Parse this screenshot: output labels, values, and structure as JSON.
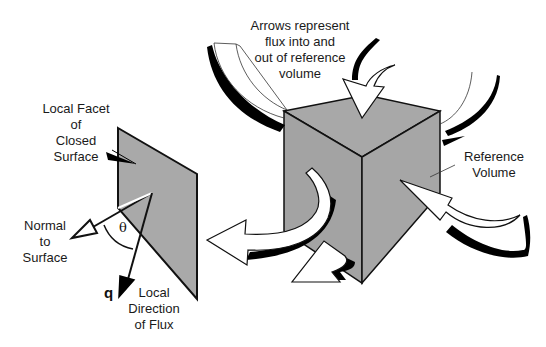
{
  "diagram": {
    "colors": {
      "facet_fill": "#a9a9a9",
      "cube_fill": "#a6a6a6",
      "outline": "#111111",
      "arrow_fill": "#ffffff",
      "shadow": "#000000"
    },
    "labels": {
      "facet": [
        "Local Facet",
        "of",
        "Closed",
        "Surface"
      ],
      "normal": [
        "Normal",
        "to",
        "Surface"
      ],
      "flux_dir": [
        "Local",
        "Direction",
        "of Flux"
      ],
      "flux_symbol": "q",
      "angle_symbol": "θ",
      "arrows_note": [
        "Arrows represent",
        "flux into and",
        "out of reference",
        "volume"
      ],
      "ref_volume": [
        "Reference",
        "Volume"
      ]
    }
  }
}
